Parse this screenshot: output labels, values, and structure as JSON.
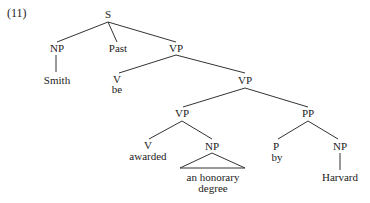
{
  "example_number": "(11)",
  "tree": {
    "S": "S",
    "NP_subject": "NP",
    "subject": "Smith",
    "tense": "Past",
    "VP_top": "VP",
    "V_be_cat": "V",
    "V_be_word": "be",
    "VP_mid": "VP",
    "VP_low": "VP",
    "PP": "PP",
    "V_awarded_cat": "V",
    "V_awarded_word": "awarded",
    "NP_object": "NP",
    "object_line1": "an honorary",
    "object_line2": "degree",
    "P_cat": "P",
    "P_word": "by",
    "NP_agent": "NP",
    "agent": "Harvard"
  }
}
